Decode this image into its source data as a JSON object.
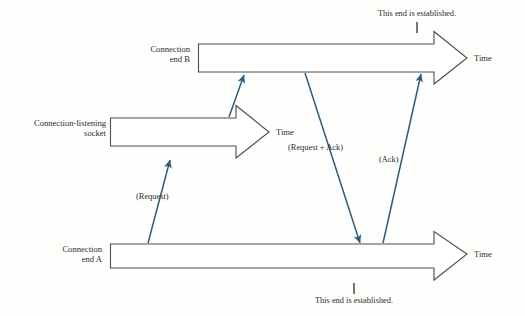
{
  "figure": {
    "background_color": "#fefefc",
    "arrow_fill": "#ffffff",
    "arrow_outline": "#4a4a4a",
    "arrow_shadow": "#0a0a0a",
    "message_arrow_color": "#2a5d7c",
    "text_color": "#2b2b2b"
  },
  "timelines": [
    {
      "id": "connection-end-b",
      "label_line1": "Connection",
      "label_line2": "end B",
      "time_label": "Time"
    },
    {
      "id": "connection-listening-socket",
      "label_line1": "Connection-listening",
      "label_line2": "socket",
      "time_label": "Time"
    },
    {
      "id": "connection-end-a",
      "label_line1": "Connection",
      "label_line2": "end A",
      "time_label": "Time"
    }
  ],
  "messages": [
    {
      "id": "request",
      "label": "(Request)"
    },
    {
      "id": "request-plus-ack",
      "label": "(Request + Ack)"
    },
    {
      "id": "ack",
      "label": "(Ack)"
    }
  ],
  "notes": [
    {
      "id": "note-top",
      "text": "This end is established."
    },
    {
      "id": "note-bottom",
      "text": "This end is established."
    }
  ]
}
